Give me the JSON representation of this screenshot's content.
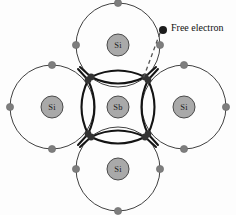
{
  "figure": {
    "type": "semiconductor-doping-diagram",
    "background_color": "#fdfdfd"
  },
  "colors": {
    "shell_stroke": "#2b2b2b",
    "bond_stroke": "#141414",
    "bond_dot_fill": "#333333",
    "valence_dot_fill": "#7e7e7e",
    "valence_dot_stroke": "#6a6a6a",
    "core_fill": "#a9a9a9",
    "core_stroke": "#4a4a4a",
    "free_electron_fill": "#1c1c1c",
    "dashed_line": "#555555",
    "label_text": "#1a1a1a"
  },
  "atoms": [
    {
      "id": "center",
      "label": "Sb",
      "cx": 118,
      "cy": 107,
      "shell_r": 42,
      "core_r": 11
    },
    {
      "id": "top",
      "label": "Si",
      "cx": 118,
      "cy": 45,
      "shell_r": 42,
      "core_r": 11
    },
    {
      "id": "left",
      "label": "Si",
      "cx": 52,
      "cy": 107,
      "shell_r": 42,
      "core_r": 11
    },
    {
      "id": "right",
      "label": "Si",
      "cx": 184,
      "cy": 107,
      "shell_r": 42,
      "core_r": 11
    },
    {
      "id": "bottom",
      "label": "Si",
      "cx": 118,
      "cy": 169,
      "shell_r": 42,
      "core_r": 11
    }
  ],
  "bond_nodes": [
    {
      "id": "tl-upper",
      "cx": 91,
      "cy": 77
    },
    {
      "id": "tr-upper",
      "cx": 145,
      "cy": 77
    },
    {
      "id": "tl-left",
      "cx": 88,
      "cy": 80
    },
    {
      "id": "tr-right",
      "cx": 148,
      "cy": 80
    },
    {
      "id": "bl-left",
      "cx": 88,
      "cy": 134
    },
    {
      "id": "br-right",
      "cx": 148,
      "cy": 134
    },
    {
      "id": "bl-lower",
      "cx": 91,
      "cy": 137
    },
    {
      "id": "br-lower",
      "cx": 145,
      "cy": 137
    }
  ],
  "valence_dots": [
    {
      "atom": "top",
      "cx": 118,
      "cy": 3
    },
    {
      "atom": "top",
      "cx": 76,
      "cy": 45
    },
    {
      "atom": "top",
      "cx": 160,
      "cy": 45
    },
    {
      "atom": "left",
      "cx": 52,
      "cy": 65
    },
    {
      "atom": "left",
      "cx": 10,
      "cy": 107
    },
    {
      "atom": "left",
      "cx": 52,
      "cy": 149
    },
    {
      "atom": "right",
      "cx": 184,
      "cy": 65
    },
    {
      "atom": "right",
      "cx": 226,
      "cy": 107
    },
    {
      "atom": "right",
      "cx": 184,
      "cy": 149
    },
    {
      "atom": "bottom",
      "cx": 76,
      "cy": 169
    },
    {
      "atom": "bottom",
      "cx": 160,
      "cy": 169
    },
    {
      "atom": "bottom",
      "cx": 118,
      "cy": 211
    }
  ],
  "free_electron": {
    "label": "Free electron",
    "dot": {
      "cx": 163,
      "cy": 30,
      "r": 4
    },
    "label_position": {
      "x": 171,
      "y": 27
    },
    "leader_line": {
      "x1": 160,
      "y1": 33,
      "x2": 143,
      "y2": 79
    }
  }
}
